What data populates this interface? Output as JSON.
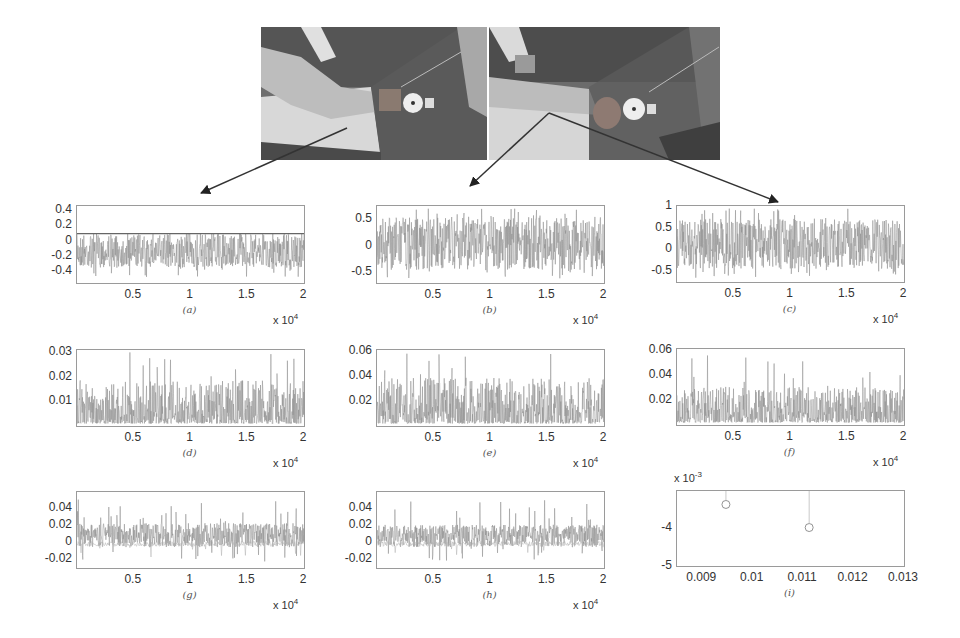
{
  "figure": {
    "photos": [
      {
        "label": "arm-photo-left",
        "desc": "grayscale photo of arm pressing force gauge, forearm flat"
      },
      {
        "label": "arm-photo-right",
        "desc": "grayscale photo of arm pressing force gauge, forearm raised"
      }
    ],
    "arrows": [
      {
        "from": [
          347,
          128
        ],
        "to": [
          201,
          193
        ]
      },
      {
        "from": [
          549,
          113
        ],
        "to": [
          470,
          186
        ]
      },
      {
        "from": [
          549,
          113
        ],
        "to": [
          778,
          202
        ]
      }
    ]
  },
  "chart_data": [
    {
      "id": "a",
      "type": "line",
      "caption": "(a)",
      "xlim": [
        0,
        20000
      ],
      "ylim": [
        -0.55,
        0.45
      ],
      "xticks": [
        "0.5",
        "1",
        "1.5",
        "2"
      ],
      "yticks": [
        "0.4",
        "0.2",
        "0",
        "-0.2",
        "-0.4"
      ],
      "x_multiplier": "x 10",
      "x_exp": "4",
      "series_desc": "dense noisy signal, upper envelope ~0.1, lower ~-0.35",
      "band": [
        -0.35,
        0.1
      ],
      "mean": -0.05
    },
    {
      "id": "b",
      "type": "line",
      "caption": "(b)",
      "xlim": [
        0,
        20000
      ],
      "ylim": [
        -0.7,
        0.75
      ],
      "xticks": [
        "0.5",
        "1",
        "1.5",
        "2"
      ],
      "yticks": [
        "0.5",
        "0",
        "-0.5"
      ],
      "x_multiplier": "x 10",
      "x_exp": "4",
      "series_desc": "dense noisy signal around 0, range ~-0.5 to 0.6",
      "band": [
        -0.45,
        0.55
      ],
      "mean": 0.05
    },
    {
      "id": "c",
      "type": "line",
      "caption": "(c)",
      "xlim": [
        0,
        20000
      ],
      "ylim": [
        -0.75,
        1.0
      ],
      "xticks": [
        "0.5",
        "1",
        "1.5",
        "2"
      ],
      "yticks": [
        "1",
        "0.5",
        "0",
        "-0.5"
      ],
      "x_multiplier": "x 10",
      "x_exp": "4",
      "series_desc": "dense noisy signal around 0.05, range ~-0.5 to 0.9",
      "band": [
        -0.45,
        0.7
      ],
      "mean": 0.05
    },
    {
      "id": "d",
      "type": "line",
      "caption": "(d)",
      "xlim": [
        0,
        20000
      ],
      "ylim": [
        0,
        0.031
      ],
      "xticks": [
        "0.5",
        "1",
        "1.5",
        "2"
      ],
      "yticks": [
        "0.03",
        "0.02",
        "0.01"
      ],
      "x_multiplier": "x 10",
      "x_exp": "4",
      "series_desc": "non-negative spiky signal mostly below 0.01, peaks to 0.03",
      "band": [
        0.001,
        0.012
      ],
      "mean": 0.004
    },
    {
      "id": "e",
      "type": "line",
      "caption": "(e)",
      "xlim": [
        0,
        20000
      ],
      "ylim": [
        0,
        0.061
      ],
      "xticks": [
        "0.5",
        "1",
        "1.5",
        "2"
      ],
      "yticks": [
        "0.06",
        "0.04",
        "0.02"
      ],
      "x_multiplier": "x 10",
      "x_exp": "4",
      "series_desc": "non-negative spiky signal ~0.01-0.02, peaks to 0.06",
      "band": [
        0.002,
        0.025
      ],
      "mean": 0.012
    },
    {
      "id": "f",
      "type": "line",
      "caption": "(f)",
      "xlim": [
        0,
        20000
      ],
      "ylim": [
        0,
        0.061
      ],
      "xticks": [
        "0.5",
        "1",
        "1.5",
        "2"
      ],
      "yticks": [
        "0.06",
        "0.04",
        "0.02"
      ],
      "x_multiplier": "x 10",
      "x_exp": "4",
      "series_desc": "non-negative spiky signal ~0.01, peaks to 0.056",
      "band": [
        0.002,
        0.02
      ],
      "mean": 0.009
    },
    {
      "id": "g",
      "type": "line",
      "caption": "(g)",
      "xlim": [
        0,
        20000
      ],
      "ylim": [
        -0.03,
        0.058
      ],
      "xticks": [
        "0.5",
        "1",
        "1.5",
        "2"
      ],
      "yticks": [
        "0.04",
        "0.02",
        "0",
        "-0.02"
      ],
      "x_multiplier": "x 10",
      "x_exp": "4",
      "series_desc": "two traces: upper ~0.012, lower ~-0.002",
      "band": [
        -0.006,
        0.022
      ],
      "mean": 0.012,
      "second_mean": -0.002
    },
    {
      "id": "h",
      "type": "line",
      "caption": "(h)",
      "xlim": [
        0,
        20000
      ],
      "ylim": [
        -0.03,
        0.058
      ],
      "xticks": [
        "0.5",
        "1",
        "1.5",
        "2"
      ],
      "yticks": [
        "0.04",
        "0.02",
        "0",
        "-0.02"
      ],
      "x_multiplier": "x 10",
      "x_exp": "4",
      "series_desc": "two traces: upper ~0.01, lower ~-0.002",
      "band": [
        -0.006,
        0.02
      ],
      "mean": 0.01,
      "second_mean": -0.002
    },
    {
      "id": "i",
      "type": "scatter",
      "caption": "(i)",
      "xlim": [
        0.0085,
        0.013
      ],
      "ylim": [
        -5,
        -3.05
      ],
      "xticks": [
        "0.009",
        "0.01",
        "0.011",
        "0.012",
        "0.013"
      ],
      "yticks": [
        "-4",
        "-5"
      ],
      "y_multiplier": "x 10",
      "y_exp": "-3",
      "points": [
        {
          "x": 0.00947,
          "y": -3.4
        },
        {
          "x": 0.01112,
          "y": -4.0
        }
      ]
    }
  ]
}
